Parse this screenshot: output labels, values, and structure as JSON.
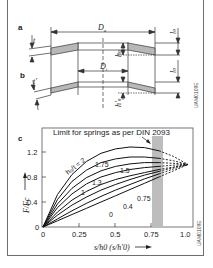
{
  "figure": {
    "panel_a_label": "a",
    "panel_b_label": "b",
    "panel_c_label": "c",
    "dims": {
      "outer_diameter": "D",
      "outer_diameter_sub": "a",
      "inner_diameter": "D",
      "inner_diameter_sub": "i",
      "thickness": "t",
      "thickness_reduced": "t′",
      "free_height": "l",
      "free_height_sub": "0",
      "cone_height": "h",
      "cone_height_sub": "0",
      "cone_height_reduced": "h′",
      "cone_height_reduced_sub": "0"
    },
    "ref_code_top": "UAM0109E",
    "ref_code_bottom": "UAM0109E"
  },
  "chart_data": {
    "type": "line",
    "title": "",
    "annotation": "Limit for springs as per DIN 2093",
    "xlabel": "s/h0 (s/h′0)",
    "ylabel": "F/Fc",
    "xlim": [
      0,
      1.0
    ],
    "ylim": [
      0,
      1.35
    ],
    "x_ticks": [
      "0",
      "0.25",
      "0.5",
      "0.75",
      "1.0"
    ],
    "y_ticks": [
      "0",
      "0.4",
      "0.8",
      "1.2"
    ],
    "limit_band": [
      0.75,
      0.83
    ],
    "legend_param": "h0/t",
    "x": [
      0,
      0.1,
      0.2,
      0.3,
      0.4,
      0.5,
      0.6,
      0.7,
      0.8,
      0.9,
      1.0
    ],
    "series": [
      {
        "name": "h0/t = 2",
        "label": "h₀/t = 2",
        "values": [
          0,
          0.52,
          0.84,
          1.05,
          1.18,
          1.25,
          1.28,
          1.27,
          1.22,
          1.13,
          1.0
        ]
      },
      {
        "name": "1.75",
        "label": "1.75",
        "values": [
          0,
          0.44,
          0.73,
          0.91,
          1.03,
          1.09,
          1.12,
          1.12,
          1.1,
          1.06,
          1.0
        ]
      },
      {
        "name": "1.5",
        "label": "1.5",
        "values": [
          0,
          0.37,
          0.62,
          0.79,
          0.9,
          0.97,
          1.01,
          1.03,
          1.03,
          1.02,
          1.0
        ]
      },
      {
        "name": "1.3",
        "label": "1.3",
        "values": [
          0,
          0.31,
          0.53,
          0.69,
          0.8,
          0.87,
          0.92,
          0.95,
          0.97,
          0.99,
          1.0
        ]
      },
      {
        "name": "1",
        "label": "1",
        "values": [
          0,
          0.24,
          0.43,
          0.57,
          0.68,
          0.76,
          0.82,
          0.87,
          0.92,
          0.96,
          1.0
        ]
      },
      {
        "name": "0.75",
        "label": "0.75",
        "values": [
          0,
          0.19,
          0.35,
          0.48,
          0.59,
          0.68,
          0.76,
          0.83,
          0.89,
          0.95,
          1.0
        ]
      },
      {
        "name": "0.4",
        "label": "0.4",
        "values": [
          0,
          0.13,
          0.26,
          0.38,
          0.49,
          0.59,
          0.68,
          0.77,
          0.85,
          0.93,
          1.0
        ]
      },
      {
        "name": "0",
        "label": "0",
        "values": [
          0,
          0.1,
          0.2,
          0.3,
          0.4,
          0.5,
          0.6,
          0.7,
          0.8,
          0.9,
          1.0
        ]
      }
    ]
  }
}
